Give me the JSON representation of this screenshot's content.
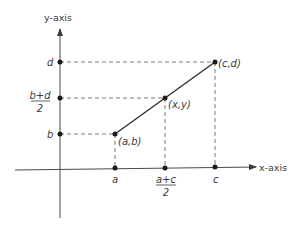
{
  "diagram": {
    "type": "coordinate-midpoint",
    "axes": {
      "x_label": "x-axis",
      "y_label": "y-axis"
    },
    "x_ticks": [
      {
        "label": "a"
      },
      {
        "label_num": "a+c",
        "label_den": "2"
      },
      {
        "label": "c"
      }
    ],
    "y_ticks": [
      {
        "label": "d"
      },
      {
        "label_num": "b+d",
        "label_den": "2"
      },
      {
        "label": "b"
      }
    ],
    "points": [
      {
        "label": "(a,b)"
      },
      {
        "label": "(x,y)"
      },
      {
        "label": "(c,d)"
      }
    ],
    "colors": {
      "line": "#2a2a2a",
      "dashed": "#6a6a6a",
      "text": "#3a3a3a"
    }
  }
}
